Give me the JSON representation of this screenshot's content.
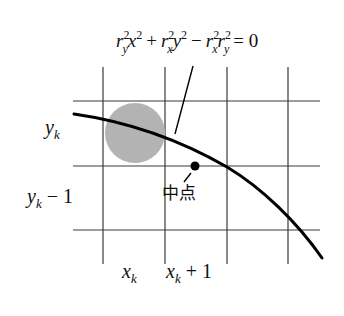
{
  "diagram": {
    "equation": {
      "text": "r_y^2 x^2 + r_x^2 y^2 − r_x^2 r_y^2 = 0",
      "parts": {
        "t1_base": "r",
        "t1_sup": "2",
        "t1_sub": "y",
        "t1_var": "x",
        "t1_var_sup": "2",
        "plus": "+",
        "t2_base": "r",
        "t2_sup": "2",
        "t2_sub": "x",
        "t2_var": "y",
        "t2_var_sup": "2",
        "minus": "−",
        "t3_base": "r",
        "t3_sup": "2",
        "t3_sub": "x",
        "t4_base": "r",
        "t4_sup": "2",
        "t4_sub": "y",
        "equals": "= 0"
      }
    },
    "labels": {
      "yk": {
        "base": "y",
        "sub": "k",
        "suffix": ""
      },
      "yk_minus_1": {
        "base": "y",
        "sub": "k",
        "suffix": " − 1"
      },
      "xk": {
        "base": "x",
        "sub": "k",
        "suffix": ""
      },
      "xk_plus_1": {
        "base": "x",
        "sub": "k",
        "suffix": " + 1"
      },
      "midpoint": "中点"
    },
    "grid": {
      "vertical_x": [
        103,
        165,
        227,
        288
      ],
      "horizontal_y": [
        101,
        166,
        230
      ],
      "line_color": "#3a3a3a"
    },
    "current_pixel": {
      "cx": 135,
      "cy": 133,
      "r": 30,
      "color": "#b3b3b3"
    },
    "midpoint_dot": {
      "cx": 195,
      "cy": 166,
      "r": 4.5,
      "color": "#000000"
    },
    "curve_color": "#000000"
  }
}
